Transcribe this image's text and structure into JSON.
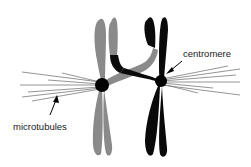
{
  "diagram": {
    "labels": {
      "centromere": "centromere",
      "microtubules": "microtubules"
    },
    "colors": {
      "gray_chromosome": "#8a8a8a",
      "black_chromosome": "#0a0a0a",
      "microtubule": "#7a7a7a",
      "background": "#ffffff",
      "text": "#1a1a1a"
    }
  }
}
